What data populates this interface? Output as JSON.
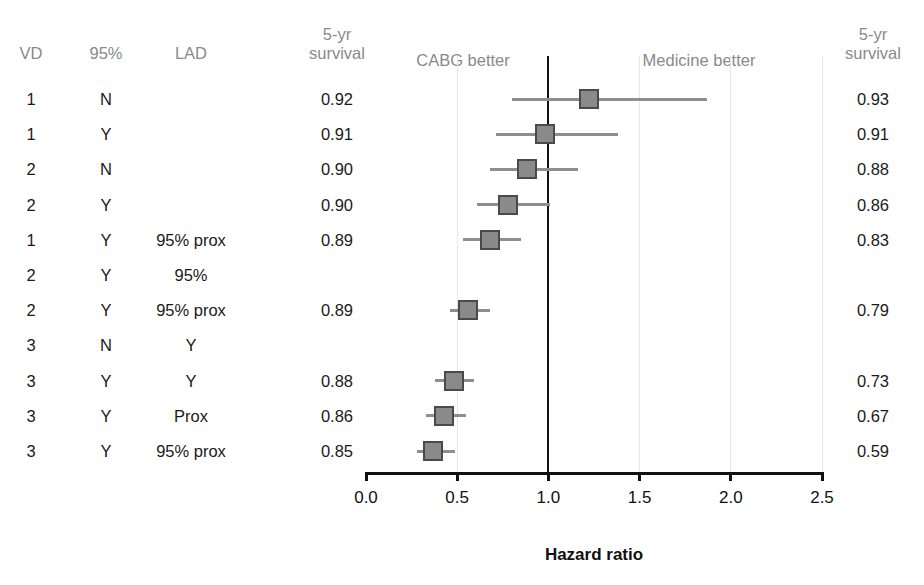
{
  "headers": {
    "vd": "VD",
    "pct95": "95%",
    "lad": "LAD",
    "left_survival_line1": "5-yr",
    "left_survival_line2": "survival",
    "right_survival_line1": "5-yr",
    "right_survival_line2": "survival",
    "cabg_better": "CABG better",
    "medicine_better": "Medicine better"
  },
  "axis": {
    "title": "Hazard ratio",
    "ticks": [
      "0.0",
      "0.5",
      "1.0",
      "1.5",
      "2.0",
      "2.5"
    ],
    "min": 0.0,
    "max": 2.5
  },
  "colors": {
    "header_text": "#8a8a8a",
    "body_text": "#1a1a1a",
    "marker_fill": "#8a8a8a",
    "marker_edge": "#4a4a4a",
    "ci_line": "#8e8e8e",
    "reference_line": "#111111",
    "gridline": "#e6e6e6",
    "axis": "#111111",
    "background": "#ffffff"
  },
  "rows": [
    {
      "vd": "1",
      "pct95": "N",
      "lad": "",
      "surv_left": "0.92",
      "surv_right": "0.93",
      "hr": 1.22,
      "lo": 0.8,
      "hi": 1.87
    },
    {
      "vd": "1",
      "pct95": "Y",
      "lad": "",
      "surv_left": "0.91",
      "surv_right": "0.91",
      "hr": 0.98,
      "lo": 0.71,
      "hi": 1.38
    },
    {
      "vd": "2",
      "pct95": "N",
      "lad": "",
      "surv_left": "0.90",
      "surv_right": "0.88",
      "hr": 0.88,
      "lo": 0.68,
      "hi": 1.16
    },
    {
      "vd": "2",
      "pct95": "Y",
      "lad": "",
      "surv_left": "0.90",
      "surv_right": "0.86",
      "hr": 0.78,
      "lo": 0.61,
      "hi": 1.01
    },
    {
      "vd": "1",
      "pct95": "Y",
      "lad": "95% prox",
      "surv_left": "0.89",
      "surv_right": "0.83",
      "hr": 0.68,
      "lo": 0.53,
      "hi": 0.85
    },
    {
      "vd": "2",
      "pct95": "Y",
      "lad": "95%",
      "surv_left": "",
      "surv_right": "",
      "hr": null,
      "lo": null,
      "hi": null
    },
    {
      "vd": "2",
      "pct95": "Y",
      "lad": "95% prox",
      "surv_left": "0.89",
      "surv_right": "0.79",
      "hr": 0.56,
      "lo": 0.46,
      "hi": 0.68
    },
    {
      "vd": "3",
      "pct95": "N",
      "lad": "Y",
      "surv_left": "",
      "surv_right": "",
      "hr": null,
      "lo": null,
      "hi": null
    },
    {
      "vd": "3",
      "pct95": "Y",
      "lad": "Y",
      "surv_left": "0.88",
      "surv_right": "0.73",
      "hr": 0.48,
      "lo": 0.38,
      "hi": 0.59
    },
    {
      "vd": "3",
      "pct95": "Y",
      "lad": "Prox",
      "surv_left": "0.86",
      "surv_right": "0.67",
      "hr": 0.43,
      "lo": 0.33,
      "hi": 0.55
    },
    {
      "vd": "3",
      "pct95": "Y",
      "lad": "95% prox",
      "surv_left": "0.85",
      "surv_right": "0.59",
      "hr": 0.37,
      "lo": 0.28,
      "hi": 0.49
    }
  ],
  "chart_data": {
    "type": "scatter",
    "subtype": "forest-plot",
    "title": "",
    "xlabel": "Hazard ratio",
    "ylabel": "",
    "xlim": [
      0.0,
      2.5
    ],
    "xticks": [
      0.0,
      0.5,
      1.0,
      1.5,
      2.0,
      2.5
    ],
    "grid": true,
    "reference_line_x": 1.0,
    "legend": [],
    "annotations": [
      "CABG better",
      "Medicine better"
    ],
    "columns": [
      "VD",
      "95%",
      "LAD",
      "5-yr survival",
      "Hazard ratio (95% CI)",
      "5-yr survival"
    ],
    "points": [
      {
        "label": "VD 1, 95% N",
        "hr": 1.22,
        "ci_low": 0.8,
        "ci_high": 1.87,
        "surv_cabg": 0.92,
        "surv_medicine": 0.93
      },
      {
        "label": "VD 1, 95% Y",
        "hr": 0.98,
        "ci_low": 0.71,
        "ci_high": 1.38,
        "surv_cabg": 0.91,
        "surv_medicine": 0.91
      },
      {
        "label": "VD 2, 95% N",
        "hr": 0.88,
        "ci_low": 0.68,
        "ci_high": 1.16,
        "surv_cabg": 0.9,
        "surv_medicine": 0.88
      },
      {
        "label": "VD 2, 95% Y",
        "hr": 0.78,
        "ci_low": 0.61,
        "ci_high": 1.01,
        "surv_cabg": 0.9,
        "surv_medicine": 0.86
      },
      {
        "label": "VD 1, 95% Y, LAD 95% prox",
        "hr": 0.68,
        "ci_low": 0.53,
        "ci_high": 0.85,
        "surv_cabg": 0.89,
        "surv_medicine": 0.83
      },
      {
        "label": "VD 2, 95% Y, LAD 95%",
        "hr": null,
        "ci_low": null,
        "ci_high": null,
        "surv_cabg": null,
        "surv_medicine": null
      },
      {
        "label": "VD 2, 95% Y, LAD 95% prox",
        "hr": 0.56,
        "ci_low": 0.46,
        "ci_high": 0.68,
        "surv_cabg": 0.89,
        "surv_medicine": 0.79
      },
      {
        "label": "VD 3, 95% N, LAD Y",
        "hr": null,
        "ci_low": null,
        "ci_high": null,
        "surv_cabg": null,
        "surv_medicine": null
      },
      {
        "label": "VD 3, 95% Y, LAD Y",
        "hr": 0.48,
        "ci_low": 0.38,
        "ci_high": 0.59,
        "surv_cabg": 0.88,
        "surv_medicine": 0.73
      },
      {
        "label": "VD 3, 95% Y, LAD Prox",
        "hr": 0.43,
        "ci_low": 0.33,
        "ci_high": 0.55,
        "surv_cabg": 0.86,
        "surv_medicine": 0.67
      },
      {
        "label": "VD 3, 95% Y, LAD 95% prox",
        "hr": 0.37,
        "ci_low": 0.28,
        "ci_high": 0.49,
        "surv_cabg": 0.85,
        "surv_medicine": 0.59
      }
    ]
  }
}
